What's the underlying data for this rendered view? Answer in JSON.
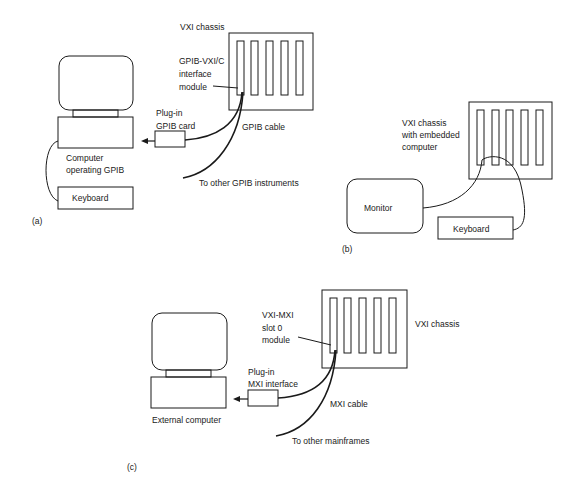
{
  "diagram": {
    "stroke_color": "#1a1a1a",
    "background": "#ffffff",
    "panel_a": {
      "tag": "(a)",
      "chassis_label": "VXI chassis",
      "module_label_1": "GPIB-VXI/C",
      "module_label_2": "interface",
      "module_label_3": "module",
      "card_label_1": "Plug-in",
      "card_label_2": "GPIB card",
      "cable_label": "GPIB cable",
      "others_label": "To other GPIB instruments",
      "computer_label_1": "Computer",
      "computer_label_2": "operating GPIB",
      "keyboard_label": "Keyboard"
    },
    "panel_b": {
      "tag": "(b)",
      "chassis_label_1": "VXI chassis",
      "chassis_label_2": "with embedded",
      "chassis_label_3": "computer",
      "monitor_label": "Monitor",
      "keyboard_label": "Keyboard"
    },
    "panel_c": {
      "tag": "(c)",
      "chassis_label": "VXI chassis",
      "module_label_1": "VXI-MXI",
      "module_label_2": "slot 0",
      "module_label_3": "module",
      "card_label_1": "Plug-in",
      "card_label_2": "MXI interface",
      "cable_label": "MXI cable",
      "others_label": "To other mainframes",
      "computer_label": "External computer"
    }
  }
}
